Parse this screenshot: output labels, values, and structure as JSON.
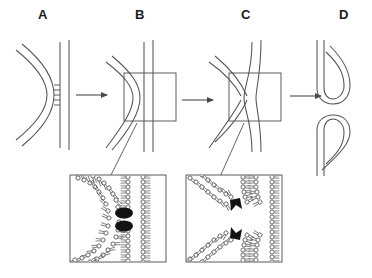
{
  "figure": {
    "background_color": "#ffffff",
    "line_color": "#4a4a4a",
    "dark_complex_color": "#1a1a1a",
    "label_color": "#1b1b1b",
    "width": 372,
    "height": 278
  },
  "panels": [
    {
      "id": "A",
      "label": "A",
      "label_x": 44,
      "label_y": 14,
      "caption_stage": "docking",
      "description": "Curved vesicle membrane tethered to flat target membrane"
    },
    {
      "id": "B",
      "label": "B",
      "label_x": 141,
      "label_y": 14,
      "caption_stage": "contact",
      "description": "Membranes in close contact, boxed region magnified below"
    },
    {
      "id": "C",
      "label": "C",
      "label_x": 247,
      "label_y": 14,
      "caption_stage": "hemifusion-stalk",
      "description": "X-shaped hemifusion stalk, boxed region magnified below"
    },
    {
      "id": "D",
      "label": "D",
      "label_x": 345,
      "label_y": 14,
      "caption_stage": "fusion-pore",
      "description": "Fully merged membranes forming open pore"
    }
  ],
  "arrows": [
    {
      "id": "arrow-a-b",
      "x1": 74,
      "y1": 95,
      "x2": 108,
      "y2": 95
    },
    {
      "id": "arrow-b-c",
      "x1": 180,
      "y1": 100,
      "x2": 214,
      "y2": 100
    },
    {
      "id": "arrow-c-d",
      "x1": 288,
      "y1": 96,
      "x2": 322,
      "y2": 96
    }
  ],
  "highlight_boxes": [
    {
      "id": "box-b",
      "x": 124,
      "y": 73,
      "width": 52,
      "height": 48
    },
    {
      "id": "box-c",
      "x": 229,
      "y": 73,
      "width": 52,
      "height": 48
    }
  ],
  "insets": [
    {
      "id": "inset-left",
      "source_panel": "B",
      "x": 70,
      "y": 175,
      "width": 96,
      "height": 87,
      "description": "Lipid bilayer detail with two dark protein complexes bridging apposed bilayers",
      "dark_complex_count": 2,
      "leader": {
        "x1": 136,
        "y1": 122,
        "x2": 110,
        "y2": 178
      }
    },
    {
      "id": "inset-right",
      "source_panel": "C",
      "x": 186,
      "y": 175,
      "width": 96,
      "height": 87,
      "description": "Lipid bilayer detail of X-shaped hemifusion stalk with two dark protein complexes",
      "dark_complex_count": 2,
      "leader": {
        "x1": 243,
        "y1": 122,
        "x2": 219,
        "y2": 180
      }
    }
  ],
  "panel_a": {
    "tether_marks": 4,
    "tether_x": 57,
    "tether_y_start": 84,
    "tether_spacing": 5,
    "vesicle_lines": 2,
    "target_membrane_lines": 2
  }
}
